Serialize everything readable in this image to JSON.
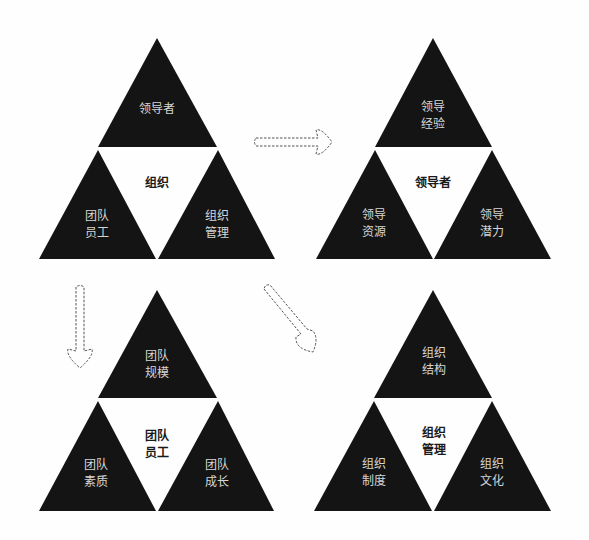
{
  "colors": {
    "triangle_fill": "#141414",
    "background": "#fefefe",
    "label_light": "#d6d6d6",
    "label_dark": "#1a1a1a",
    "arrow_stroke": "#555555"
  },
  "diagrams": [
    {
      "id": "organization",
      "center": {
        "line1": "组织",
        "line2": ""
      },
      "top": {
        "line1": "领导者",
        "line2": ""
      },
      "left": {
        "line1": "团队",
        "line2": "员工"
      },
      "right": {
        "line1": "组织",
        "line2": "管理"
      }
    },
    {
      "id": "leader",
      "center": {
        "line1": "领导者",
        "line2": ""
      },
      "top": {
        "line1": "领导",
        "line2": "经验"
      },
      "left": {
        "line1": "领导",
        "line2": "资源"
      },
      "right": {
        "line1": "领导",
        "line2": "潜力"
      }
    },
    {
      "id": "team-staff",
      "center": {
        "line1": "团队",
        "line2": "员工"
      },
      "top": {
        "line1": "团队",
        "line2": "规模"
      },
      "left": {
        "line1": "团队",
        "line2": "素质"
      },
      "right": {
        "line1": "团队",
        "line2": "成长"
      }
    },
    {
      "id": "org-management",
      "center": {
        "line1": "组织",
        "line2": "管理"
      },
      "top": {
        "line1": "组织",
        "line2": "结构"
      },
      "left": {
        "line1": "组织",
        "line2": "制度"
      },
      "right": {
        "line1": "组织",
        "line2": "文化"
      }
    }
  ],
  "arrows": [
    {
      "id": "arrow-right",
      "from": "organization",
      "to": "leader",
      "direction": "right"
    },
    {
      "id": "arrow-down",
      "from": "organization",
      "to": "team-staff",
      "direction": "down"
    },
    {
      "id": "arrow-diagonal",
      "from": "organization",
      "to": "org-management",
      "direction": "down-right"
    }
  ]
}
